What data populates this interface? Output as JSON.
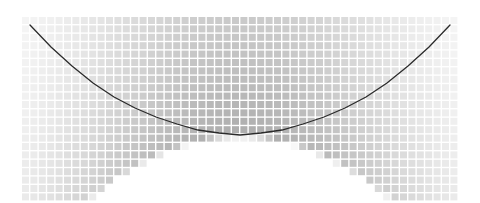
{
  "chart_data": {
    "type": "heatmap",
    "title": "",
    "subtitle": "",
    "xlabel": "",
    "ylabel": "",
    "grid": true,
    "legend": null,
    "legend_position": "none",
    "annotations": [],
    "xtick_labels": [],
    "ytick_labels": [],
    "xlim": [
      -1.0,
      1.0
    ],
    "ylim": [
      0.0,
      1.0
    ],
    "colormap": "greys",
    "colorbar": false,
    "cell_gap_color": "#ffffff",
    "max_color": "#1a1a1a",
    "min_color": "#ffffff",
    "grid_geometry": {
      "origin_x": 22,
      "origin_y": 17,
      "cell_size": 8.4,
      "cell_fill": 7.0,
      "n_cols": 52,
      "n_rows": 22
    },
    "density_model": {
      "note": "Intensity I(col,row) derived from distance above the parabola y = a*(x-x0)^2 + y0 mapped through an exponential decay; columns near the parabola floor are dark, cells below the parabola are blank.",
      "parabola_a": 0.00276,
      "parabola_x0": 240,
      "parabola_y0": 135,
      "top_value": 1.0,
      "decay_rows": 9.5,
      "vertical_falloff": 0.62
    },
    "overlay_curve": {
      "name": "fit",
      "color": "#2b2b2b",
      "width": 1.3,
      "type": "parabola",
      "x_start": 30,
      "x_end": 450,
      "points": [
        [
          30,
          25
        ],
        [
          51,
          47
        ],
        [
          72,
          66
        ],
        [
          93,
          83
        ],
        [
          114,
          97
        ],
        [
          135,
          108
        ],
        [
          156,
          117
        ],
        [
          177,
          124
        ],
        [
          198,
          130
        ],
        [
          219,
          133
        ],
        [
          240,
          135
        ],
        [
          261,
          133
        ],
        [
          282,
          130
        ],
        [
          303,
          124
        ],
        [
          324,
          117
        ],
        [
          345,
          108
        ],
        [
          366,
          97
        ],
        [
          387,
          83
        ],
        [
          408,
          66
        ],
        [
          429,
          47
        ],
        [
          450,
          25
        ]
      ]
    }
  },
  "figure": {
    "width": 480,
    "height": 203,
    "background": "#ffffff"
  }
}
